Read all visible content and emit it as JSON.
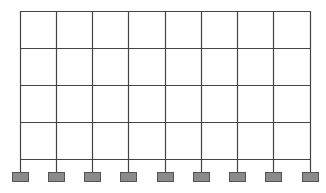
{
  "diagram": {
    "type": "structural-frame",
    "bays": 8,
    "stories": 4,
    "column_x": [
      20,
      56,
      92,
      128,
      165,
      201,
      237,
      273,
      310
    ],
    "floor_y": [
      11,
      48,
      85,
      122,
      159
    ],
    "support": {
      "y": 172,
      "width": 16,
      "height": 9,
      "fill": "#8a8a8a",
      "stroke": "#555555"
    },
    "colors": {
      "line": "#444444",
      "background": "#ffffff"
    }
  }
}
